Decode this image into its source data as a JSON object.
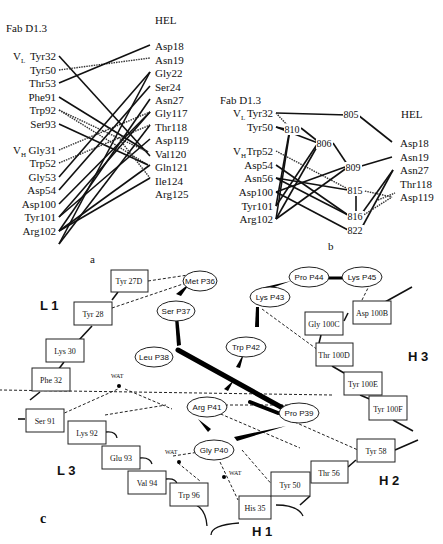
{
  "panel_a": {
    "label": "a",
    "left_title": "Fab D1.3",
    "right_title": "HEL",
    "vl_prefix": "V",
    "vl_sub": "L",
    "vh_prefix": "V",
    "vh_sub": "H",
    "antibody_residues": [
      "Tyr32",
      "Tyr50",
      "Thr53",
      "Phe91",
      "Trp92",
      "Ser93",
      "Gly31",
      "Trp52",
      "Gly53",
      "Asp54",
      "Asp100",
      "Tyr101",
      "Arg102"
    ],
    "antigen_residues": [
      "Asp18",
      "Asn19",
      "Gly22",
      "Ser24",
      "Asn27",
      "Gly117",
      "Thr118",
      "Asp119",
      "Val120",
      "Gln121",
      "Ile124",
      "Arg125"
    ]
  },
  "panel_b": {
    "label": "b",
    "left_title": "Fab D1.3",
    "right_title": "HEL",
    "antibody_residues": [
      "Tyr32",
      "Tyr50",
      "Trp52",
      "Asp54",
      "Asn56",
      "Asp100",
      "Tyr101",
      "Arg102"
    ],
    "waters": [
      "805",
      "810",
      "806",
      "809",
      "815",
      "816",
      "822"
    ],
    "antigen_residues": [
      "Asp18",
      "Asn19",
      "Asn27",
      "Thr118",
      "Asp119"
    ]
  },
  "panel_c": {
    "label": "c",
    "regions": {
      "L1": "L 1",
      "L3": "L 3",
      "H1": "H 1",
      "H2": "H 2",
      "H3": "H 3"
    },
    "peptide_residues": [
      "Met P36",
      "Ser P37",
      "Leu P38",
      "Pro P39",
      "Gly P40",
      "Arg P41",
      "Trp P42",
      "Lys P43",
      "Pro P44",
      "Lys P45"
    ],
    "antibody_residues": [
      "Tyr 27D",
      "Tyr 28",
      "Lys 30",
      "Phe 32",
      "Ser 91",
      "Lys 92",
      "Glu 93",
      "Val 94",
      "Trp 96",
      "His 35",
      "Tyr 50",
      "Thr 56",
      "Tyr 58",
      "Gly 100C",
      "Asp 100B",
      "Thr 100D",
      "Tyr 100E",
      "Tyr 100F"
    ],
    "water_label": "WAT"
  }
}
